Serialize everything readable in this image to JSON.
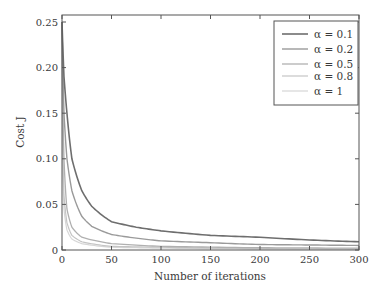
{
  "chart_data": {
    "type": "line",
    "title": "",
    "xlabel": "Number of iterations",
    "ylabel": "Cost J",
    "xlim": [
      0,
      300
    ],
    "ylim": [
      0,
      0.26
    ],
    "xticks": [
      0,
      50,
      100,
      150,
      200,
      250,
      300
    ],
    "xtick_labels": [
      "0",
      "50",
      "100",
      "150",
      "200",
      "250",
      "300"
    ],
    "yticks": [
      0,
      0.05,
      0.1,
      0.15,
      0.2,
      0.25
    ],
    "ytick_labels": [
      "0",
      "0.05",
      "0.10",
      "0.15",
      "0.20",
      "0.25"
    ],
    "grid": false,
    "legend_position": "upper right",
    "series": [
      {
        "name": "α = 0.1",
        "color": "#6e6e6e",
        "width": 1.6,
        "x": [
          0,
          2,
          5,
          10,
          20,
          30,
          50,
          75,
          100,
          150,
          200,
          250,
          300
        ],
        "y": [
          0.25,
          0.19,
          0.15,
          0.1,
          0.065,
          0.048,
          0.031,
          0.025,
          0.021,
          0.016,
          0.014,
          0.011,
          0.009
        ]
      },
      {
        "name": "α = 0.2",
        "color": "#9a9a9a",
        "width": 1.4,
        "x": [
          0,
          2,
          5,
          10,
          20,
          30,
          50,
          75,
          100,
          150,
          200,
          250,
          300
        ],
        "y": [
          0.25,
          0.15,
          0.1,
          0.065,
          0.037,
          0.026,
          0.017,
          0.013,
          0.01,
          0.008,
          0.006,
          0.0055,
          0.005
        ]
      },
      {
        "name": "α = 0.5",
        "color": "#b0b0b0",
        "width": 1.3,
        "x": [
          0,
          1,
          2,
          5,
          10,
          20,
          50,
          100,
          200,
          300
        ],
        "y": [
          0.25,
          0.15,
          0.1,
          0.045,
          0.025,
          0.014,
          0.007,
          0.004,
          0.0025,
          0.002
        ]
      },
      {
        "name": "α = 0.8",
        "color": "#c4c4c4",
        "width": 1.2,
        "x": [
          0,
          1,
          2,
          5,
          10,
          20,
          50,
          100,
          200,
          300
        ],
        "y": [
          0.25,
          0.1,
          0.06,
          0.03,
          0.016,
          0.009,
          0.004,
          0.003,
          0.0015,
          0.001
        ]
      },
      {
        "name": "α = 1",
        "color": "#d6d6d6",
        "width": 1.2,
        "x": [
          0,
          1,
          2,
          5,
          10,
          20,
          50,
          100,
          200,
          300
        ],
        "y": [
          0.25,
          0.08,
          0.045,
          0.022,
          0.012,
          0.007,
          0.003,
          0.002,
          0.0012,
          0.001
        ]
      }
    ]
  }
}
